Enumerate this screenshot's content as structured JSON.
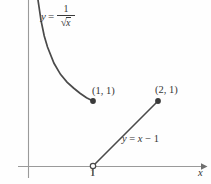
{
  "figure": {
    "background_color": "#fefefe",
    "ink_color": "#3a3a3a",
    "axis_color": "#8a8a8a"
  },
  "labels": {
    "curve": {
      "lhs": "y",
      "equals": "=",
      "numerator": "1",
      "radical_sign": "√",
      "radicand": "x"
    },
    "line": {
      "lhs": "y",
      "equals": "=",
      "variable": "x",
      "minus": "−",
      "constant": "1"
    },
    "point_a": "(1, 1)",
    "point_b": "(2, 1)",
    "x_tick": "1",
    "x_axis": "x"
  },
  "chart_data": {
    "type": "line",
    "title": "",
    "xlabel": "x",
    "ylabel": "",
    "grid": false,
    "legend": "none",
    "axes": {
      "origin_px": [
        28,
        166
      ],
      "x_unit_px": 65,
      "y_unit_px": 65,
      "xlim": [
        -0.15,
        2.8
      ],
      "ylim": [
        -0.27,
        2.6
      ],
      "x_ticks": [
        {
          "value": 1,
          "label": "1"
        }
      ],
      "y_ticks": [],
      "x_arrow": true,
      "y_arrow": false
    },
    "series": [
      {
        "name": "y = 1/sqrt(x)",
        "type": "curve",
        "equation": "y = 1/sqrt(x)",
        "domain": [
          0.12,
          1
        ],
        "points": [
          {
            "x": 0.12,
            "y": 2.89
          },
          {
            "x": 0.15,
            "y": 2.58
          },
          {
            "x": 0.2,
            "y": 2.24
          },
          {
            "x": 0.25,
            "y": 2.0
          },
          {
            "x": 0.3,
            "y": 1.83
          },
          {
            "x": 0.4,
            "y": 1.58
          },
          {
            "x": 0.5,
            "y": 1.41
          },
          {
            "x": 0.6,
            "y": 1.29
          },
          {
            "x": 0.7,
            "y": 1.2
          },
          {
            "x": 0.8,
            "y": 1.12
          },
          {
            "x": 0.9,
            "y": 1.05
          },
          {
            "x": 1.0,
            "y": 1.0
          }
        ],
        "endpoint": {
          "x": 1,
          "y": 1,
          "marker": "filled-dot"
        }
      },
      {
        "name": "y = x - 1",
        "type": "segment",
        "equation": "y = x - 1",
        "from": {
          "x": 1,
          "y": 0,
          "marker": "open-dot"
        },
        "to": {
          "x": 2,
          "y": 1,
          "marker": "filled-dot"
        }
      }
    ],
    "annotations": [
      {
        "text": "(1, 1)",
        "x": 1,
        "y": 1,
        "placement": "upper-right"
      },
      {
        "text": "(2, 1)",
        "x": 2,
        "y": 1,
        "placement": "upper-right"
      },
      {
        "text": "y = 1/sqrt(x)",
        "x": 0.25,
        "y": 2.45,
        "placement": "right-of-curve"
      },
      {
        "text": "y = x - 1",
        "x": 1.45,
        "y": 0.5,
        "placement": "right-of-line"
      }
    ]
  }
}
